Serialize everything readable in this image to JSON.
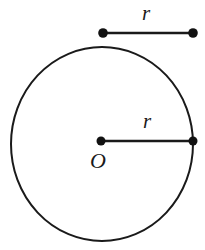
{
  "figure": {
    "background_color": "#ffffff",
    "stroke_color": "#1a1a1a",
    "labels": {
      "standalone_radius": "r",
      "circle_radius": "r",
      "center_point": "O"
    },
    "geometry": {
      "circle": {
        "cx": 102,
        "cy": 144,
        "rx": 91,
        "ry": 97,
        "stroke_width": 2
      },
      "center_dot": {
        "cx": 101,
        "cy": 141,
        "r": 4.5
      },
      "radius_line": {
        "x1": 101,
        "y1": 141,
        "x2": 193,
        "y2": 141,
        "stroke_width": 2.4
      },
      "radius_end_dot": {
        "cx": 193,
        "cy": 141,
        "r": 4.5
      },
      "standalone_segment": {
        "x1": 103,
        "y1": 33,
        "x2": 193,
        "y2": 33,
        "stroke_width": 2.4
      },
      "standalone_left_dot": {
        "cx": 103,
        "cy": 33,
        "r": 4.8
      },
      "standalone_right_dot": {
        "cx": 193,
        "cy": 33,
        "r": 4.8
      },
      "label_positions": {
        "standalone_radius": {
          "x": 146,
          "y": 15
        },
        "circle_radius": {
          "x": 147,
          "y": 123
        },
        "center_point": {
          "x": 98,
          "y": 163
        }
      }
    }
  }
}
